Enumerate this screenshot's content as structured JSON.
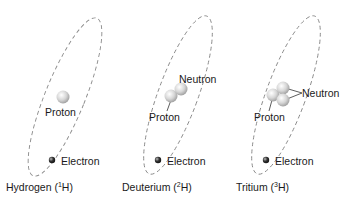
{
  "atoms": [
    {
      "name": "Hydrogen",
      "symbol": "H",
      "mass_number": "1",
      "caption_prefix": "Hydrogen (",
      "caption_suffix": "H)",
      "labels": {
        "proton": "Proton",
        "electron": "Electron"
      }
    },
    {
      "name": "Deuterium",
      "symbol": "H",
      "mass_number": "2",
      "caption_prefix": "Deuterium (",
      "caption_suffix": "H)",
      "labels": {
        "proton": "Proton",
        "neutron": "Neutron",
        "electron": "Electron"
      }
    },
    {
      "name": "Tritium",
      "symbol": "H",
      "mass_number": "3",
      "caption_prefix": "Tritium (",
      "caption_suffix": "H)",
      "labels": {
        "proton": "Proton",
        "neutron": "Neutron",
        "electron": "Electron"
      }
    }
  ],
  "colors": {
    "orbit": "#8a8a8a",
    "nucleon": "#d8d8d8",
    "electron": "#333333",
    "text": "#1a1a1a"
  }
}
